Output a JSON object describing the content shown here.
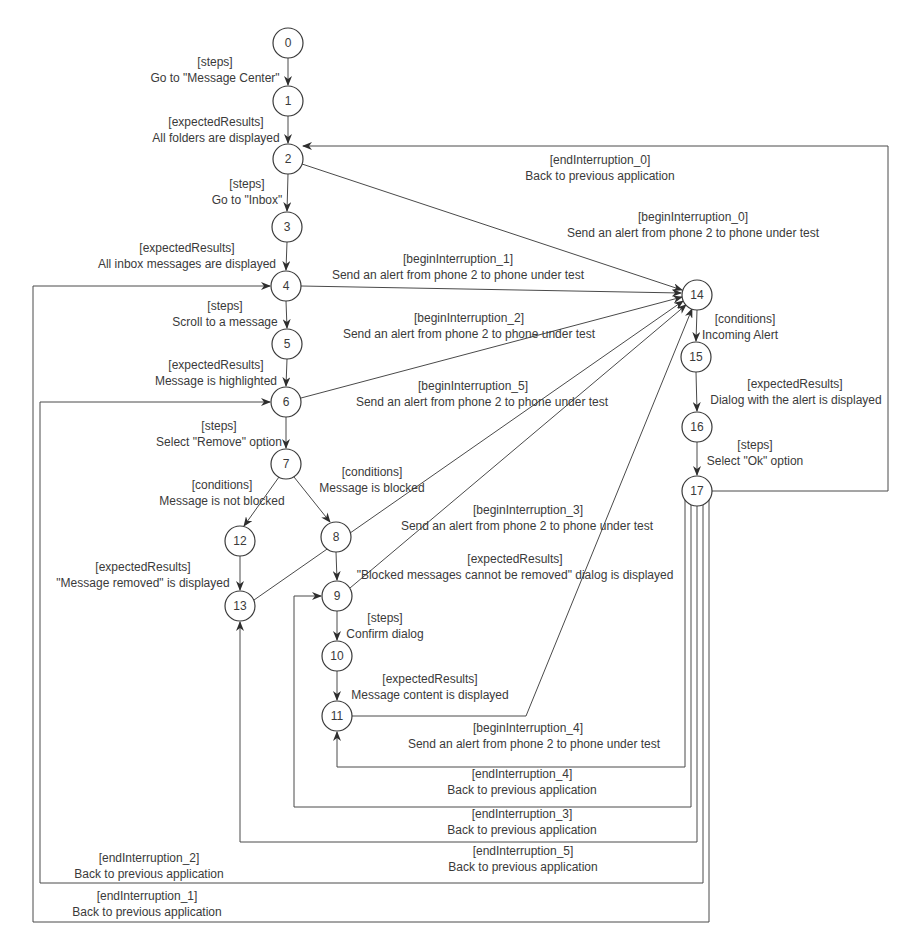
{
  "diagram": {
    "type": "state-transition-graph",
    "colors": {
      "background": "#ffffff",
      "stroke": "#3a3a3a",
      "text": "#3a3a3a"
    },
    "nodes": [
      {
        "id": "0",
        "label": "0",
        "x": 288,
        "y": 43
      },
      {
        "id": "1",
        "label": "1",
        "x": 288,
        "y": 101
      },
      {
        "id": "2",
        "label": "2",
        "x": 288,
        "y": 159
      },
      {
        "id": "3",
        "label": "3",
        "x": 287,
        "y": 227
      },
      {
        "id": "4",
        "label": "4",
        "x": 286,
        "y": 286
      },
      {
        "id": "5",
        "label": "5",
        "x": 287,
        "y": 344
      },
      {
        "id": "6",
        "label": "6",
        "x": 286,
        "y": 402
      },
      {
        "id": "7",
        "label": "7",
        "x": 286,
        "y": 464
      },
      {
        "id": "8",
        "label": "8",
        "x": 336,
        "y": 537
      },
      {
        "id": "9",
        "label": "9",
        "x": 337,
        "y": 596
      },
      {
        "id": "10",
        "label": "10",
        "x": 337,
        "y": 656
      },
      {
        "id": "11",
        "label": "11",
        "x": 337,
        "y": 716
      },
      {
        "id": "12",
        "label": "12",
        "x": 240,
        "y": 541
      },
      {
        "id": "13",
        "label": "13",
        "x": 240,
        "y": 606
      },
      {
        "id": "14",
        "label": "14",
        "x": 697,
        "y": 295
      },
      {
        "id": "15",
        "label": "15",
        "x": 696,
        "y": 357
      },
      {
        "id": "16",
        "label": "16",
        "x": 697,
        "y": 427
      },
      {
        "id": "17",
        "label": "17",
        "x": 697,
        "y": 491
      }
    ],
    "edges": [
      {
        "from": "0",
        "to": "1",
        "kind": "[steps]",
        "text": "Go to \"Message Center\""
      },
      {
        "from": "1",
        "to": "2",
        "kind": "[expectedResults]",
        "text": "All folders are displayed"
      },
      {
        "from": "2",
        "to": "3",
        "kind": "[steps]",
        "text": "Go to \"Inbox\""
      },
      {
        "from": "3",
        "to": "4",
        "kind": "[expectedResults]",
        "text": "All inbox messages are displayed"
      },
      {
        "from": "4",
        "to": "5",
        "kind": "[steps]",
        "text": "Scroll to a message"
      },
      {
        "from": "5",
        "to": "6",
        "kind": "[expectedResults]",
        "text": "Message is highlighted"
      },
      {
        "from": "6",
        "to": "7",
        "kind": "[steps]",
        "text": "Select \"Remove\" option"
      },
      {
        "from": "7",
        "to": "12",
        "kind": "[conditions]",
        "text": "Message is not blocked"
      },
      {
        "from": "7",
        "to": "8",
        "kind": "[conditions]",
        "text": "Message is blocked"
      },
      {
        "from": "12",
        "to": "13",
        "kind": "[expectedResults]",
        "text": "\"Message removed\" is displayed"
      },
      {
        "from": "8",
        "to": "9",
        "kind": "[expectedResults]",
        "text": "\"Blocked messages cannot be removed\" dialog is displayed"
      },
      {
        "from": "9",
        "to": "10",
        "kind": "[steps]",
        "text": "Confirm dialog"
      },
      {
        "from": "10",
        "to": "11",
        "kind": "[expectedResults]",
        "text": "Message content is displayed"
      },
      {
        "from": "14",
        "to": "15",
        "kind": "[conditions]",
        "text": "Incoming Alert"
      },
      {
        "from": "15",
        "to": "16",
        "kind": "[expectedResults]",
        "text": "Dialog with the alert is displayed"
      },
      {
        "from": "16",
        "to": "17",
        "kind": "[steps]",
        "text": "Select \"Ok\" option"
      },
      {
        "from": "2",
        "to": "14",
        "kind": "[beginInterruption_0]",
        "text": "Send an alert from phone 2 to phone under test"
      },
      {
        "from": "4",
        "to": "14",
        "kind": "[beginInterruption_1]",
        "text": "Send an alert from phone 2 to phone under test"
      },
      {
        "from": "6",
        "to": "14",
        "kind": "[beginInterruption_2]",
        "text": "Send an alert from phone 2 to phone under test"
      },
      {
        "from": "9",
        "to": "14",
        "kind": "[beginInterruption_3]",
        "text": "Send an alert from phone 2 to phone under test"
      },
      {
        "from": "11",
        "to": "14",
        "kind": "[beginInterruption_4]",
        "text": "Send an alert from phone 2 to phone under test"
      },
      {
        "from": "13",
        "to": "14",
        "kind": "[beginInterruption_5]",
        "text": "Send an alert from phone 2 to phone under test"
      },
      {
        "from": "17",
        "to": "2",
        "kind": "[endInterruption_0]",
        "text": "Back to previous application"
      },
      {
        "from": "17",
        "to": "4",
        "kind": "[endInterruption_1]",
        "text": "Back to previous application"
      },
      {
        "from": "17",
        "to": "6",
        "kind": "[endInterruption_2]",
        "text": "Back to previous application"
      },
      {
        "from": "17",
        "to": "9",
        "kind": "[endInterruption_3]",
        "text": "Back to previous application"
      },
      {
        "from": "17",
        "to": "11",
        "kind": "[endInterruption_4]",
        "text": "Back to previous application"
      },
      {
        "from": "17",
        "to": "13",
        "kind": "[endInterruption_5]",
        "text": "Back to previous application"
      }
    ]
  }
}
